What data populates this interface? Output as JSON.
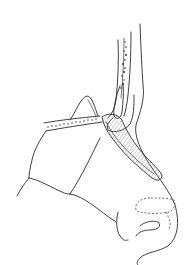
{
  "figure": {
    "kind": "medical-line-illustration",
    "colors": {
      "background": "#ffffff",
      "ink": "#2a2a2a",
      "shading": "#9a9a9a"
    }
  }
}
